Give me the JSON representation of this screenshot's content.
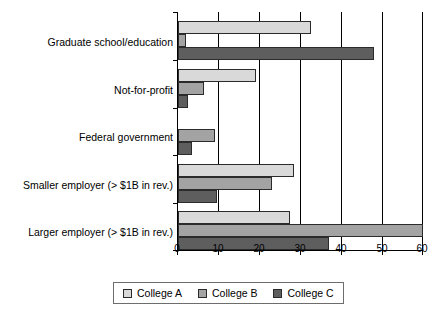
{
  "chart_data": {
    "type": "bar",
    "orientation": "horizontal",
    "title": "",
    "subtitle": "",
    "xlabel": "",
    "ylabel": "",
    "xlim": [
      0,
      60
    ],
    "xticks": [
      0,
      10,
      20,
      30,
      40,
      50,
      60
    ],
    "xtick_labels": [
      "0",
      "10",
      "20",
      "30",
      "40",
      "50",
      "60"
    ],
    "grid": true,
    "grid_axis": "x",
    "legend_position": "bottom",
    "categories": [
      "Graduate school/education",
      "Not-for-profit",
      "Federal government",
      "Smaller employer (> $1B in rev.)",
      "Larger employer (> $1B in rev.)"
    ],
    "series": [
      {
        "name": "College A",
        "color": "#d9d9d9",
        "values": [
          32.5,
          19,
          0,
          28.5,
          27.5
        ]
      },
      {
        "name": "College B",
        "color": "#a3a3a3",
        "values": [
          2,
          6.3,
          9,
          23,
          60
        ]
      },
      {
        "name": "College C",
        "color": "#5e5e5e",
        "values": [
          48,
          2.5,
          3.5,
          9.5,
          37
        ]
      }
    ],
    "legend": [
      "College A",
      "College B",
      "College C"
    ]
  }
}
